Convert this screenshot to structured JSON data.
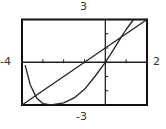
{
  "labels": {
    "ymax": "3",
    "xmin": "-4",
    "xmax": "2",
    "ymin": "-3"
  },
  "colors": {
    "curve": "#222222",
    "frame": "#111111",
    "background": "#ffffff"
  },
  "chart_data": {
    "type": "line",
    "title": "",
    "xlabel": "",
    "ylabel": "",
    "xlim": [
      -4,
      2
    ],
    "ylim": [
      -3,
      3
    ],
    "x_ticks": [
      -4,
      -3,
      -2,
      -1,
      0,
      1,
      2
    ],
    "y_ticks": [
      -3,
      -2,
      -1,
      0,
      1,
      2,
      3
    ],
    "grid": false,
    "legend": null,
    "series": [
      {
        "name": "line",
        "x": [
          -4,
          -3,
          -2,
          -1,
          0,
          1,
          2
        ],
        "y": [
          -3,
          -2,
          -1,
          0,
          1,
          2,
          3
        ]
      },
      {
        "name": "curve",
        "x": [
          -3.85,
          -3.6,
          -3.3,
          -3.0,
          -2.6,
          -2.0,
          -1.5,
          -1.0,
          -0.5,
          0,
          0.4,
          0.75,
          1.0,
          1.35
        ],
        "y": [
          -0.2,
          -1.6,
          -2.5,
          -2.9,
          -3.0,
          -2.85,
          -2.5,
          -1.9,
          -1.0,
          0,
          0.9,
          1.75,
          2.3,
          3.0
        ]
      }
    ],
    "intersections": [
      {
        "x": -3.4,
        "y": -2.4
      },
      {
        "x": 0.75,
        "y": 1.75
      }
    ]
  }
}
